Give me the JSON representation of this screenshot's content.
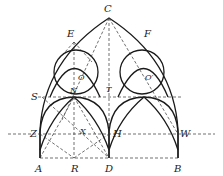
{
  "figure": {
    "labels": {
      "C": "C",
      "E": "E",
      "F": "F",
      "O": "O",
      "O_prime": "O′",
      "S": "S",
      "N": "N",
      "T": "T",
      "Z": "Z",
      "X": "X",
      "H": "H",
      "W": "W",
      "A": "A",
      "R": "R",
      "D": "D",
      "B": "B"
    },
    "colors": {
      "stroke": "#1a1a1a",
      "background": "#ffffff"
    }
  }
}
